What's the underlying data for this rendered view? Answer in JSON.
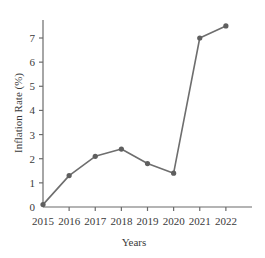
{
  "chart_data": {
    "type": "line",
    "title": "",
    "subtitle": "",
    "xlabel": "Years",
    "ylabel": "Inflation Rate (%)",
    "categories": [
      "2015",
      "2016",
      "2017",
      "2018",
      "2019",
      "2020",
      "2021",
      "2022"
    ],
    "values": [
      0.1,
      1.3,
      2.1,
      2.4,
      1.8,
      1.4,
      7.0,
      7.5
    ],
    "series": [
      {
        "name": "Inflation Rate",
        "values": [
          0.1,
          1.3,
          2.1,
          2.4,
          1.8,
          1.4,
          7.0,
          7.5
        ]
      }
    ],
    "ylim": [
      0,
      7.8
    ],
    "yticks": [
      "0",
      "1",
      "2",
      "3",
      "4",
      "5",
      "6",
      "7"
    ],
    "ytick_values": [
      0,
      1,
      2,
      3,
      4,
      5,
      6,
      7
    ],
    "xticks": [
      "2015",
      "2016",
      "2017",
      "2018",
      "2019",
      "2020",
      "2021",
      "2022"
    ],
    "grid": false,
    "legend": "none",
    "line_color": "#6e6e6e",
    "marker_color": "#5f5f5f",
    "axis_color": "#6b6b6b",
    "text_color": "#3a3a3a",
    "background_color": "#ffffff",
    "marker": "circle"
  }
}
